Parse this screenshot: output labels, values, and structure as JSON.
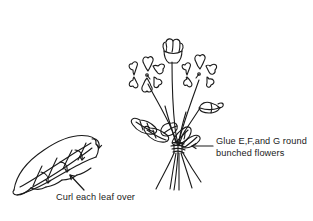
{
  "figure": {
    "background_color": "#ffffff",
    "ink_color": "#1a1a1a"
  },
  "annotations": {
    "glue": {
      "line1": "Glue E,F,and G round",
      "line2": "bunched flowers",
      "pointer": "arrow-left"
    },
    "curl": {
      "text": "Curl each leaf over",
      "pointer": "arrow-diagonal"
    }
  },
  "caption": {
    "text": ""
  },
  "illustrations": {
    "bouquet": {
      "name": "bunched-flowers",
      "flower_count": 3,
      "bud_count": 1,
      "leaf_count": 5,
      "stem_count": 5,
      "binding_label": "glue point"
    },
    "leaf": {
      "name": "curled-leaf",
      "arrow_count": 4
    }
  }
}
